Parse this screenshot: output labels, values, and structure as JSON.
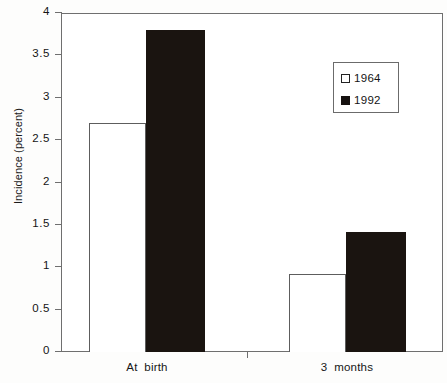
{
  "chart_data": {
    "type": "bar",
    "title": "",
    "xlabel": "",
    "ylabel": "Incidence (percent)",
    "categories": [
      "At  birth",
      "3  months"
    ],
    "series": [
      {
        "name": "1964",
        "values": [
          2.7,
          0.92
        ],
        "style": "open"
      },
      {
        "name": "1992",
        "values": [
          3.8,
          1.42
        ],
        "style": "filled"
      }
    ],
    "ylim": [
      0,
      4
    ],
    "yticks": [
      0,
      0.5,
      1,
      1.5,
      2,
      2.5,
      3,
      3.5,
      4
    ],
    "ytick_labels": [
      "0",
      "0.5",
      "1",
      "1.5",
      "2",
      "2.5",
      "3",
      "3.5",
      "4"
    ],
    "grid": false,
    "legend_position": "upper right",
    "colors": {
      "open": "#ffffff",
      "filled": "#1a1410",
      "axis": "#6f6f6f",
      "text": "#141414"
    }
  },
  "axes": {
    "y_label": "Incidence (percent)",
    "ticks": [
      {
        "value": 4,
        "label": "4"
      },
      {
        "value": 3.5,
        "label": "3.5"
      },
      {
        "value": 3,
        "label": "3"
      },
      {
        "value": 2.5,
        "label": "2.5"
      },
      {
        "value": 2,
        "label": "2"
      },
      {
        "value": 1.5,
        "label": "1.5"
      },
      {
        "value": 1,
        "label": "1"
      },
      {
        "value": 0.5,
        "label": "0.5"
      },
      {
        "value": 0,
        "label": "0"
      }
    ]
  },
  "categories": [
    {
      "label": "At  birth"
    },
    {
      "label": "3  months"
    }
  ],
  "legend": {
    "entries": [
      {
        "label": "1964",
        "style": "open"
      },
      {
        "label": "1992",
        "style": "filled"
      }
    ]
  },
  "bars": [
    {
      "group": "At  birth",
      "series": "1964",
      "value": 2.7,
      "style": "open"
    },
    {
      "group": "At  birth",
      "series": "1992",
      "value": 3.8,
      "style": "filled"
    },
    {
      "group": "3  months",
      "series": "1964",
      "value": 0.92,
      "style": "open"
    },
    {
      "group": "3  months",
      "series": "1992",
      "value": 1.42,
      "style": "filled"
    }
  ]
}
